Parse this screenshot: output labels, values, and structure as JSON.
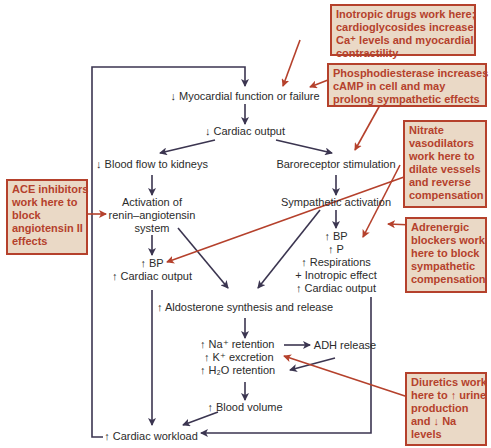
{
  "colors": {
    "flow_line": "#3b3550",
    "drug_line": "#b5412c",
    "note_fill": "#ead9c6",
    "note_border": "#b5412c",
    "note_text": "#b5412c",
    "node_text": "#2b2b2b"
  },
  "nodes": {
    "myocardial": "↓ Myocardial function or failure",
    "cardiac_output": "↓ Cardiac output",
    "blood_flow": "↓ Blood flow to kidneys",
    "baroreceptor": "Baroreceptor stimulation",
    "renin": [
      "Activation of",
      "renin–angiotensin",
      "system"
    ],
    "sympathetic": "Sympathetic activation",
    "left_effects": [
      "↑ BP",
      "↑ Cardiac output"
    ],
    "right_effects": [
      "↑ BP",
      "↑ P",
      "↑ Respirations",
      "+ Inotropic effect",
      "↑ Cardiac output"
    ],
    "aldosterone": "↑ Aldosterone synthesis and release",
    "retention": [
      "↑ Na⁺ retention",
      "↑ K⁺ excretion",
      "↑ H₂O retention"
    ],
    "adh": "ADH release",
    "blood_volume": "↑ Blood volume",
    "workload": "↑ Cardiac workload"
  },
  "notes": {
    "inotropic": [
      "Inotropic drugs work here;",
      "cardioglycosides increase",
      "Ca⁺ levels and myocardial",
      "contractility"
    ],
    "phosphodiesterase": [
      "Phosphodiesterase increases",
      "cAMP in cell and may",
      "prolong sympathetic effects"
    ],
    "nitrate": [
      "Nitrate",
      "vasodilators",
      "work here to",
      "dilate vessels",
      "and reverse",
      "compensation"
    ],
    "ace": [
      "ACE inhibitors",
      "work here to",
      "block",
      "angiotensin II",
      "effects"
    ],
    "adrenergic": [
      "Adrenergic",
      "blockers work",
      "here to block",
      "sympathetic",
      "compensation"
    ],
    "diuretics": [
      "Diuretics work",
      "here to ↑ urine",
      "production",
      "and ↓ Na",
      "levels"
    ]
  }
}
